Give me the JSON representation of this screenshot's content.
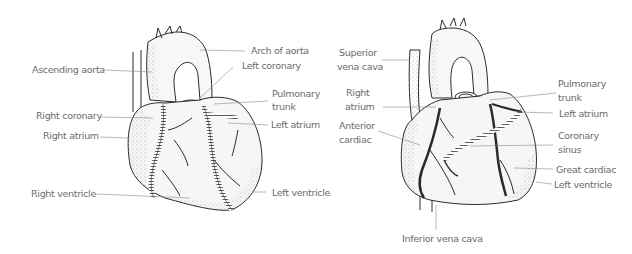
{
  "diagram": {
    "type": "anatomical-illustration",
    "colors": {
      "line": "#2a2a2a",
      "label": "#6b6b6b",
      "leader": "#8a8a8a",
      "fill": "#f6f6f6",
      "background": "#ffffff"
    },
    "anterior_view": {
      "labels": [
        {
          "id": "arch-of-aorta",
          "text": "Arch of aorta"
        },
        {
          "id": "ascending-aorta",
          "text": "Ascending aorta"
        },
        {
          "id": "left-coronary",
          "text": "Left coronary"
        },
        {
          "id": "pulmonary-trunk-1",
          "text": "Pulmonary"
        },
        {
          "id": "pulmonary-trunk-2",
          "text": "trunk"
        },
        {
          "id": "right-coronary",
          "text": "Right coronary"
        },
        {
          "id": "left-atrium",
          "text": "Left atrium"
        },
        {
          "id": "right-atrium",
          "text": "Right atrium"
        },
        {
          "id": "right-ventricle",
          "text": "Right ventricle"
        },
        {
          "id": "left-ventricle",
          "text": "Left ventricle"
        }
      ]
    },
    "venous_view": {
      "labels": [
        {
          "id": "superior-vena-cava-1",
          "text": "Superior"
        },
        {
          "id": "superior-vena-cava-2",
          "text": "vena cava"
        },
        {
          "id": "right-atrium-1",
          "text": "Right"
        },
        {
          "id": "right-atrium-2",
          "text": "atrium"
        },
        {
          "id": "anterior-cardiac-1",
          "text": "Anterior"
        },
        {
          "id": "anterior-cardiac-2",
          "text": "cardiac"
        },
        {
          "id": "pulmonary-trunk-1",
          "text": "Pulmonary"
        },
        {
          "id": "pulmonary-trunk-2",
          "text": "trunk"
        },
        {
          "id": "left-atrium",
          "text": "Left atrium"
        },
        {
          "id": "coronary-sinus-1",
          "text": "Coronary"
        },
        {
          "id": "coronary-sinus-2",
          "text": "sinus"
        },
        {
          "id": "great-cardiac",
          "text": "Great cardiac"
        },
        {
          "id": "left-ventricle",
          "text": "Left ventricle"
        },
        {
          "id": "inferior-vena-cava",
          "text": "Inferior vena cava"
        }
      ]
    }
  }
}
